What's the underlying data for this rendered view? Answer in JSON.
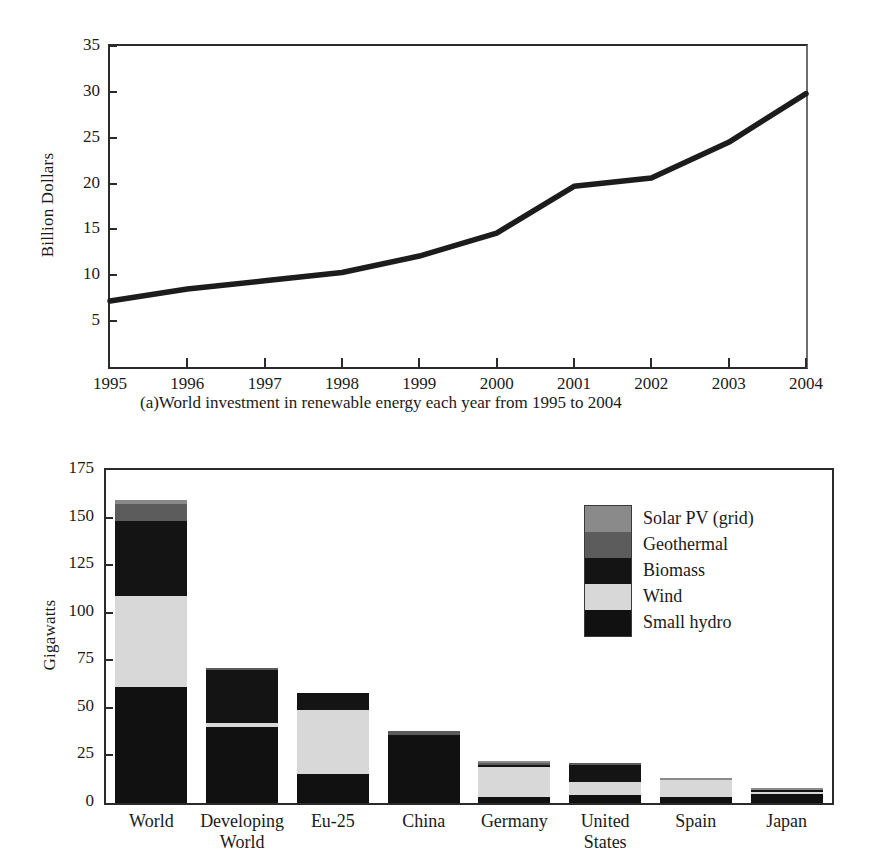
{
  "page": {
    "background": "#ffffff",
    "ink": "#1a1a1a"
  },
  "chart_data": [
    {
      "id": "line-chart",
      "type": "line",
      "title": "",
      "caption": "(a)World investment in renewable energy each year from 1995 to 2004",
      "xlabel": "",
      "ylabel": "Billion Dollars",
      "x": [
        1995,
        1996,
        1997,
        1998,
        1999,
        2000,
        2001,
        2002,
        2003,
        2004
      ],
      "xtick_labels": [
        "1995",
        "1996",
        "1997",
        "1998",
        "1999",
        "2000",
        "2001",
        "2002",
        "2003",
        "2004"
      ],
      "ytick_labels": [
        "5",
        "10",
        "15",
        "20",
        "25",
        "30",
        "35"
      ],
      "yticks": [
        5,
        10,
        15,
        20,
        25,
        30,
        35
      ],
      "ylim": [
        0,
        35
      ],
      "xlim": [
        1995,
        2004
      ],
      "grid": false,
      "legend": "none",
      "series": [
        {
          "name": "World investment in renewable energy",
          "color": "#1c1c1c",
          "values": [
            7.2,
            8.5,
            9.4,
            10.3,
            12.1,
            14.6,
            19.7,
            20.6,
            24.5,
            29.8
          ]
        }
      ]
    },
    {
      "id": "bar-chart",
      "type": "bar",
      "subtype": "stacked",
      "title": "",
      "xlabel": "",
      "ylabel": "Gigawatts",
      "categories": [
        "World",
        "Developing World",
        "Eu-25",
        "China",
        "Germany",
        "United States",
        "Spain",
        "Japan"
      ],
      "category_lines": [
        [
          "World"
        ],
        [
          "Developing",
          "World"
        ],
        [
          "Eu-25"
        ],
        [
          "China"
        ],
        [
          "Germany"
        ],
        [
          "United",
          "States"
        ],
        [
          "Spain"
        ],
        [
          "Japan"
        ]
      ],
      "ytick_labels": [
        "0",
        "25",
        "50",
        "75",
        "100",
        "125",
        "150",
        "175"
      ],
      "yticks": [
        0,
        25,
        50,
        75,
        100,
        125,
        150,
        175
      ],
      "ylim": [
        0,
        175
      ],
      "grid": false,
      "legend": "inside-upper-right",
      "series": [
        {
          "name": "Small hydro",
          "color": "#111111",
          "values": [
            61,
            40,
            15,
            35,
            3,
            4,
            3,
            5
          ]
        },
        {
          "name": "Wind",
          "color": "#d8d8d8",
          "values": [
            48,
            2,
            34,
            0,
            16,
            7,
            9,
            1
          ]
        },
        {
          "name": "Biomass",
          "color": "#141414",
          "values": [
            39,
            28,
            9,
            1,
            1,
            9,
            0,
            1
          ]
        },
        {
          "name": "Geothermal",
          "color": "#5c5c5c",
          "values": [
            9,
            1,
            0,
            2,
            1,
            1,
            0,
            0
          ]
        },
        {
          "name": "Solar PV (grid)",
          "color": "#8a8a8a",
          "values": [
            2,
            0,
            0,
            0,
            1,
            0,
            1,
            1
          ]
        }
      ],
      "totals": [
        159,
        71,
        58,
        38,
        22,
        21,
        13,
        8
      ]
    }
  ],
  "line_chart": {
    "y_axis_title": "Billion Dollars",
    "caption": "(a)World investment in renewable energy each year from 1995 to 2004"
  },
  "bar_chart": {
    "y_axis_title": "Gigawatts",
    "legend": {
      "items": [
        {
          "label": "Solar PV (grid)",
          "color": "#8a8a8a"
        },
        {
          "label": "Geothermal",
          "color": "#5c5c5c"
        },
        {
          "label": "Biomass",
          "color": "#141414"
        },
        {
          "label": "Wind",
          "color": "#d8d8d8"
        },
        {
          "label": "Small hydro",
          "color": "#111111"
        }
      ]
    }
  }
}
